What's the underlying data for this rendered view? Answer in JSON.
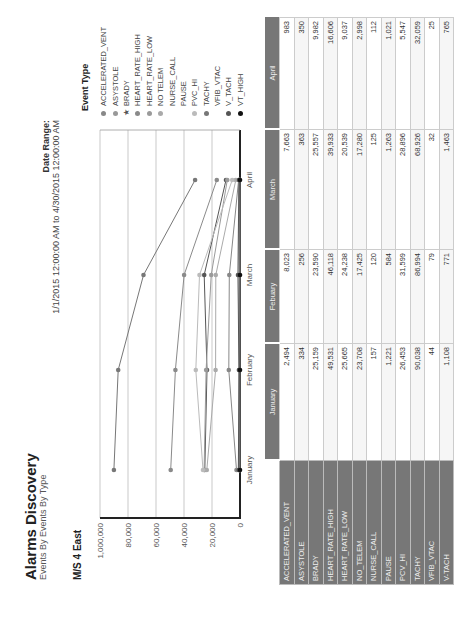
{
  "header": {
    "title": "Alarms Discovery",
    "subtitle": "Events By Events By Type",
    "unit": "M/S 4 East",
    "date_range_label": "Date Range:",
    "date_range_value": "1/1/2015 12:00:00 AM to 4/30/2015 12:00:00 AM"
  },
  "legend": {
    "title": "Event Type",
    "items": [
      {
        "label": "ACCELERATED_VENT",
        "color": "#888888",
        "marker": "dot"
      },
      {
        "label": "ASYSTOLE",
        "color": "#999999",
        "marker": "dot"
      },
      {
        "label": "BRADY",
        "color": "#555555",
        "marker": "star"
      },
      {
        "label": "HEART_RATE_HIGH",
        "color": "#8a8a8a",
        "marker": "dot"
      },
      {
        "label": "HEART_RATE_LOW",
        "color": "#9a9a9a",
        "marker": "dot"
      },
      {
        "label": "NO TELEM",
        "color": "#aaaaaa",
        "marker": "dot"
      },
      {
        "label": "NURSE_CALL",
        "color": "",
        "marker": "none"
      },
      {
        "label": "PAUSE",
        "color": "",
        "marker": "none"
      },
      {
        "label": "PVC_HI",
        "color": "#bbbbbb",
        "marker": "dot"
      },
      {
        "label": "TACHY",
        "color": "#777777",
        "marker": "dot"
      },
      {
        "label": "VFIB_VTAC",
        "color": "",
        "marker": "none"
      },
      {
        "label": "V_TACH",
        "color": "#555555",
        "marker": "dot"
      },
      {
        "label": "VT_HIGH",
        "color": "#111111",
        "marker": "dot"
      }
    ]
  },
  "table": {
    "columns": [
      "January",
      "Febuary",
      "March",
      "April"
    ],
    "rows": [
      {
        "label": "ACCELERATED_VENT",
        "values": [
          "2,494",
          "8,023",
          "7,663",
          "983"
        ]
      },
      {
        "label": "ASYSTOLE",
        "values": [
          "334",
          "256",
          "363",
          "350"
        ]
      },
      {
        "label": "BRADY",
        "values": [
          "25,159",
          "23,590",
          "25,557",
          "9,982"
        ]
      },
      {
        "label": "HEART_RATE_HIGH",
        "values": [
          "49,531",
          "46,118",
          "39,933",
          "16,606"
        ]
      },
      {
        "label": "HEART_RATE_LOW",
        "values": [
          "25,665",
          "24,238",
          "20,539",
          "9,037"
        ]
      },
      {
        "label": "NO_TELEM",
        "values": [
          "23,708",
          "17,425",
          "17,280",
          "2,998"
        ]
      },
      {
        "label": "NURSE_CALL",
        "values": [
          "157",
          "120",
          "125",
          "112"
        ]
      },
      {
        "label": "PAUSE",
        "values": [
          "1,221",
          "584",
          "1,263",
          "1,021"
        ]
      },
      {
        "label": "PCV_HI",
        "values": [
          "26,453",
          "31,599",
          "28,896",
          "5,547"
        ]
      },
      {
        "label": "TACHY",
        "values": [
          "90,038",
          "86,994",
          "68,926",
          "32,059"
        ]
      },
      {
        "label": "VFIB_VTAC",
        "values": [
          "44",
          "79",
          "32",
          "25"
        ]
      },
      {
        "label": "V-TACH",
        "values": [
          "1,108",
          "771",
          "1,463",
          "765"
        ]
      }
    ]
  },
  "chart_data": {
    "type": "line",
    "title": "Alarms Discovery",
    "subtitle": "Events By Events By Type",
    "xlabel": "",
    "ylabel": "",
    "categories": [
      "January",
      "February",
      "March",
      "April"
    ],
    "y_tick_labels": [
      "0",
      "20,000",
      "40,000",
      "60,000",
      "80,000",
      "1,000,000"
    ],
    "ylim": [
      0,
      100000
    ],
    "grid": true,
    "legend_position": "right",
    "legend_title": "Event Type",
    "series": [
      {
        "name": "ACCELERATED_VENT",
        "values": [
          2494,
          8023,
          7663,
          983
        ],
        "color": "#888888"
      },
      {
        "name": "ASYSTOLE",
        "values": [
          334,
          256,
          363,
          350
        ],
        "color": "#999999"
      },
      {
        "name": "BRADY",
        "values": [
          25159,
          23590,
          25557,
          9982
        ],
        "color": "#555555"
      },
      {
        "name": "HEART_RATE_HIGH",
        "values": [
          49531,
          46118,
          39933,
          16606
        ],
        "color": "#8a8a8a"
      },
      {
        "name": "HEART_RATE_LOW",
        "values": [
          25665,
          24238,
          20539,
          9037
        ],
        "color": "#9a9a9a"
      },
      {
        "name": "NO TELEM",
        "values": [
          23708,
          17425,
          17280,
          2998
        ],
        "color": "#aaaaaa"
      },
      {
        "name": "NURSE_CALL",
        "values": [
          157,
          120,
          125,
          112
        ],
        "color": "#cccccc"
      },
      {
        "name": "PAUSE",
        "values": [
          1221,
          584,
          1263,
          1021
        ],
        "color": "#c0c0c0"
      },
      {
        "name": "PVC_HI",
        "values": [
          26453,
          31599,
          28896,
          5547
        ],
        "color": "#bbbbbb"
      },
      {
        "name": "TACHY",
        "values": [
          90038,
          86994,
          68926,
          32059
        ],
        "color": "#777777"
      },
      {
        "name": "VFIB_VTAC",
        "values": [
          44,
          79,
          32,
          25
        ],
        "color": "#dddddd"
      },
      {
        "name": "V_TACH",
        "values": [
          1108,
          771,
          1463,
          765
        ],
        "color": "#555555"
      },
      {
        "name": "VT_HIGH",
        "values": [
          0,
          0,
          0,
          0
        ],
        "color": "#111111"
      }
    ]
  }
}
